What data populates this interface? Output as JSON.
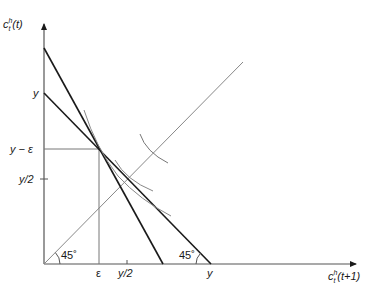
{
  "diagram": {
    "type": "economics-budget-indifference",
    "axes": {
      "y_label": {
        "base": "c",
        "sub": "t",
        "sup": "h",
        "arg": "(t)"
      },
      "x_label": {
        "base": "c",
        "sub": "t",
        "sup": "h",
        "arg": "(t+1)"
      }
    },
    "y_ticks": [
      {
        "label": "y",
        "y": 93
      },
      {
        "label": "y − ε",
        "y": 149
      },
      {
        "label": "y/2",
        "y": 179
      }
    ],
    "x_ticks": [
      {
        "label": "ε",
        "x": 99
      },
      {
        "label": "y/2",
        "x": 127
      },
      {
        "label": "y",
        "x": 211
      }
    ],
    "angle_labels": [
      {
        "label": "45˚",
        "position": "origin"
      },
      {
        "label": "45˚",
        "position": "budget-line-x-intercept"
      }
    ],
    "lines": [
      {
        "name": "steep-budget-line",
        "from": [
          44,
          48
        ],
        "to": [
          163,
          264
        ]
      },
      {
        "name": "budget-line",
        "from": [
          44,
          93
        ],
        "to": [
          211,
          264
        ]
      },
      {
        "name": "45-degree-line",
        "from": [
          44,
          264
        ],
        "to": [
          243,
          62
        ]
      },
      {
        "name": "epsilon-vertical",
        "from": [
          99,
          149
        ],
        "to": [
          99,
          264
        ]
      },
      {
        "name": "y-minus-epsilon-horizontal",
        "from": [
          44,
          149
        ],
        "to": [
          99,
          149
        ]
      }
    ],
    "curves": [
      "indifference-curve-through-endowment",
      "indifference-curve-tangent",
      "indifference-curve-arc-upper"
    ]
  }
}
